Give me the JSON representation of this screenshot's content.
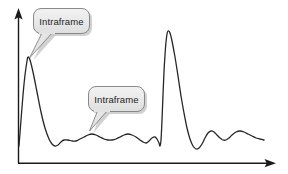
{
  "figure": {
    "background_color": "#ffffff",
    "width": 288,
    "height": 174
  },
  "axes": {
    "x_axis": {
      "name": "x-axis",
      "label": "",
      "arrow": "right",
      "color": "#1a1a1a"
    },
    "y_axis": {
      "name": "y-axis",
      "label": "",
      "arrow": "up",
      "color": "#1a1a1a"
    },
    "grid": false,
    "tick_labels": []
  },
  "callouts": [
    {
      "id": "callout-intraframe-1",
      "label": "Intraframe",
      "fill": "#e9e9e9",
      "border_color": "#7d7d7d",
      "text_color": "#1c1c1c",
      "shadow_color": "#c9c9c9",
      "points_to": "first-peak"
    },
    {
      "id": "callout-intraframe-2",
      "label": "Intraframe",
      "fill": "#e9e9e9",
      "border_color": "#7d7d7d",
      "text_color": "#1c1c1c",
      "shadow_color": "#c9c9c9",
      "points_to": "interframe-ripple"
    }
  ],
  "chart_data": {
    "type": "line",
    "xlabel": "",
    "ylabel": "",
    "grid": false,
    "legend": "none",
    "axis_arrows": true,
    "xlim": [
      0,
      288
    ],
    "ylim": [
      0,
      174
    ],
    "series": [
      {
        "name": "bitrate",
        "color": "#262626",
        "line_width": 1.3,
        "points": [
          [
            19,
            146
          ],
          [
            21,
            120
          ],
          [
            23,
            95
          ],
          [
            25,
            75
          ],
          [
            27,
            61
          ],
          [
            28,
            57
          ],
          [
            30,
            60
          ],
          [
            33,
            72
          ],
          [
            37,
            92
          ],
          [
            41,
            112
          ],
          [
            45,
            128
          ],
          [
            49,
            139
          ],
          [
            52,
            144
          ],
          [
            55,
            146
          ],
          [
            58,
            145
          ],
          [
            61,
            142
          ],
          [
            64,
            140
          ],
          [
            68,
            140
          ],
          [
            72,
            141
          ],
          [
            76,
            141
          ],
          [
            80,
            139
          ],
          [
            84,
            137
          ],
          [
            88,
            135
          ],
          [
            92,
            134
          ],
          [
            96,
            135
          ],
          [
            100,
            137
          ],
          [
            104,
            139
          ],
          [
            108,
            140
          ],
          [
            112,
            140
          ],
          [
            116,
            139
          ],
          [
            120,
            137
          ],
          [
            124,
            135
          ],
          [
            128,
            134
          ],
          [
            132,
            135
          ],
          [
            136,
            137
          ],
          [
            140,
            140
          ],
          [
            143,
            142
          ],
          [
            146,
            143
          ],
          [
            149,
            141
          ],
          [
            152,
            138
          ],
          [
            155,
            137
          ],
          [
            157,
            139
          ],
          [
            159,
            143
          ],
          [
            160,
            146
          ],
          [
            161,
            140
          ],
          [
            162,
            120
          ],
          [
            163,
            95
          ],
          [
            164,
            72
          ],
          [
            165,
            55
          ],
          [
            166,
            42
          ],
          [
            167,
            34
          ],
          [
            168,
            31
          ],
          [
            170,
            33
          ],
          [
            172,
            41
          ],
          [
            175,
            57
          ],
          [
            178,
            76
          ],
          [
            181,
            96
          ],
          [
            184,
            113
          ],
          [
            187,
            128
          ],
          [
            190,
            139
          ],
          [
            193,
            146
          ],
          [
            196,
            149
          ],
          [
            199,
            148
          ],
          [
            202,
            144
          ],
          [
            205,
            138
          ],
          [
            208,
            133
          ],
          [
            211,
            131
          ],
          [
            214,
            132
          ],
          [
            217,
            135
          ],
          [
            220,
            138
          ],
          [
            223,
            140
          ],
          [
            226,
            140
          ],
          [
            229,
            138
          ],
          [
            232,
            135
          ],
          [
            236,
            132
          ],
          [
            240,
            131
          ],
          [
            244,
            132
          ],
          [
            248,
            134
          ],
          [
            252,
            136
          ],
          [
            256,
            138
          ],
          [
            260,
            139
          ],
          [
            264,
            140
          ]
        ]
      }
    ],
    "annotations": [
      {
        "text": "Intraframe",
        "target_x": 28,
        "target_y": 57,
        "box_x": 33,
        "box_y": 8
      },
      {
        "text": "Intraframe",
        "target_x": 90,
        "target_y": 132,
        "box_x": 88,
        "box_y": 86
      }
    ]
  }
}
